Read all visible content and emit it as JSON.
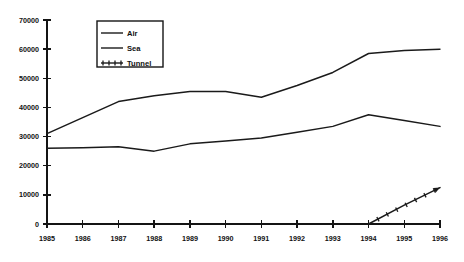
{
  "chart_data": {
    "type": "line",
    "title": "",
    "subtitle": "",
    "xlabel": "",
    "ylabel": "",
    "x": [
      1985,
      1986,
      1987,
      1988,
      1989,
      1990,
      1991,
      1992,
      1993,
      1994,
      1995,
      1996
    ],
    "categories": [
      "1985",
      "1986",
      "1987",
      "1988",
      "1989",
      "1990",
      "1991",
      "1992",
      "1993",
      "1994",
      "1995",
      "1996"
    ],
    "xlim": [
      1985,
      1996
    ],
    "ylim": [
      0,
      70000
    ],
    "y_ticks": [
      0,
      10000,
      20000,
      30000,
      40000,
      50000,
      60000,
      70000
    ],
    "y_tick_labels": [
      "0",
      "10000",
      "20000",
      "30000",
      "40000",
      "50000",
      "60000",
      "70000"
    ],
    "x_tick_labels": [
      "1985",
      "1986",
      "1987",
      "1988",
      "1989",
      "1990",
      "1991",
      "1992",
      "1993",
      "1994",
      "1995",
      "1996"
    ],
    "grid": false,
    "legend_position": "top-center",
    "series": [
      {
        "name": "Air",
        "marker": "none",
        "color": "#1a1a1a",
        "values": [
          31000,
          36500,
          42000,
          44000,
          45500,
          45500,
          43500,
          47500,
          52000,
          58500,
          59500,
          60000
        ]
      },
      {
        "name": "Sea",
        "marker": "none",
        "color": "#1a1a1a",
        "values": [
          26000,
          26200,
          26500,
          25000,
          27500,
          28500,
          29500,
          31500,
          33500,
          37500,
          35500,
          33500
        ]
      },
      {
        "name": "Tunnel",
        "marker": "cross",
        "color": "#1a1a1a",
        "values": [
          null,
          null,
          null,
          null,
          null,
          null,
          null,
          null,
          null,
          0,
          6500,
          12500
        ]
      }
    ],
    "legend_entries": [
      "Air",
      "Sea",
      "Tunnel"
    ]
  },
  "axes": {
    "y_axis_name": "value-axis",
    "x_axis_name": "year-axis"
  },
  "colors": {
    "background": "#ffffff",
    "ink": "#1a1a1a",
    "axis": "#141414"
  }
}
